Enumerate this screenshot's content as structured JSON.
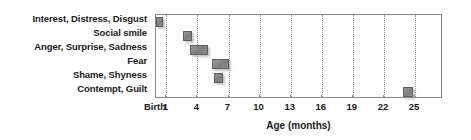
{
  "chart_data": {
    "type": "bar",
    "title": "",
    "subtitle": "",
    "xlabel": "Age (months)",
    "ylabel": "",
    "xlim": [
      0,
      27.7
    ],
    "grid": true,
    "legend": null,
    "orientation": "horizontal",
    "tick_values": [
      0,
      1,
      4,
      7,
      10,
      13,
      16,
      19,
      22,
      25
    ],
    "tick_labels": [
      "Birth",
      "1",
      "4",
      "7",
      "10",
      "13",
      "16",
      "19",
      "22",
      "25"
    ],
    "categories": [
      "Interest, Distress, Disgust",
      "Social smile",
      "Anger, Surprise, Sadness",
      "Fear",
      "Shame, Shyness",
      "Contempt, Guilt"
    ],
    "series": [
      {
        "name": "Age of emergence (months)",
        "ranges": [
          {
            "category": "Interest, Distress, Disgust",
            "start": 0.0,
            "end": 0.7
          },
          {
            "category": "Social smile",
            "start": 2.6,
            "end": 3.5
          },
          {
            "category": "Anger, Surprise, Sadness",
            "start": 3.3,
            "end": 5.0
          },
          {
            "category": "Fear",
            "start": 5.4,
            "end": 7.0
          },
          {
            "category": "Shame, Shyness",
            "start": 5.6,
            "end": 6.5
          },
          {
            "category": "Contempt, Guilt",
            "start": 23.8,
            "end": 24.8
          }
        ]
      }
    ],
    "colors": {
      "marker_fill": "#7e7e7e",
      "marker_border": "#5e5e5e",
      "gridline": "#9a9a9a",
      "axis": "#8a8a8a",
      "text": "#1a1a1a",
      "background": "#ffffff"
    }
  }
}
